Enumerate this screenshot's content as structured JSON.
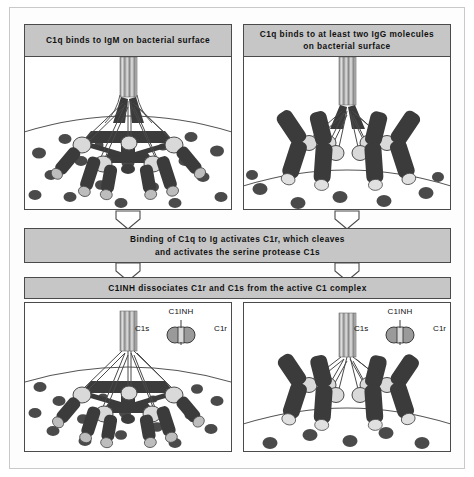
{
  "figure": {
    "background_color": "#ffffff",
    "frame_color": "#c9c9c9",
    "box_fill": "#c6c6c6",
    "box_border": "#4a4a4a",
    "membrane_fill": "#ffffff",
    "molecule_dark": "#3b3b3b",
    "molecule_light": "#d9d9d9",
    "dot_color": "#4a4a4a"
  },
  "panels": {
    "top_left": {
      "header": "C1q binds to IgM on bacterial surface",
      "content_name": "c1q-igm-bacterial-surface-illustration",
      "antibody_type": "IgM",
      "antibody_arms": 5
    },
    "top_right": {
      "header": "C1q binds to at least two IgG molecules on bacterial surface",
      "header_line_1": "C1q binds to at least two IgG molecules",
      "header_line_2": "on bacterial surface",
      "content_name": "c1q-igg-bacterial-surface-illustration",
      "antibody_type": "IgG",
      "antibody_arms": 4
    },
    "bottom_left": {
      "content_name": "c1inh-dissociation-igm-illustration",
      "antibody_type": "IgM"
    },
    "bottom_right": {
      "content_name": "c1inh-dissociation-igg-illustration",
      "antibody_type": "IgG"
    }
  },
  "process_boxes": [
    {
      "id": "c1r-activation",
      "text": "Binding of C1q to Ig activates C1r, which cleaves and activates the serine protease C1s",
      "line_1": "Binding of C1q to Ig activates C1r, which cleaves",
      "line_2": "and activates the serine protease C1s"
    },
    {
      "id": "c1inh-dissociation",
      "text": "C1INH dissociates C1r and C1s from the active C1 complex",
      "line_1": "C1INH dissociates C1r and C1s from the active C1 complex",
      "line_2": ""
    }
  ],
  "inhibitor_labels": {
    "top": "C1INH",
    "left": "C1s",
    "right": "C1r"
  },
  "arrows": {
    "direction": "down",
    "style": "white-outline-triangle",
    "count": 4
  }
}
